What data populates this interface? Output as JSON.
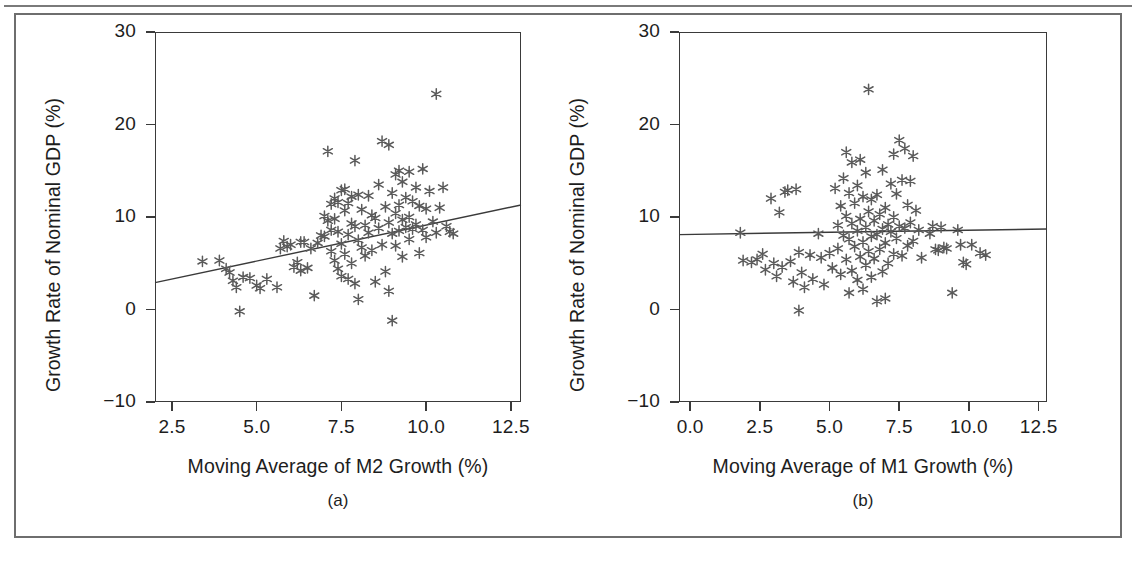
{
  "figure": {
    "panels": [
      {
        "id": "panel-a",
        "caption": "(a)",
        "xlabel": "Moving Average of M2 Growth (%)",
        "ylabel": "Growth Rate of Nominal GDP (%)",
        "xticks": [
          "2.5",
          "5.0",
          "7.5",
          "10.0",
          "12.5"
        ],
        "yticks": [
          "30",
          "20",
          "10",
          "0",
          "−10"
        ]
      },
      {
        "id": "panel-b",
        "caption": "(b)",
        "xlabel": "Moving Average of M1 Growth (%)",
        "ylabel": "Growth Rate of Nominal GDP (%)",
        "xticks": [
          "0.0",
          "2.5",
          "5.0",
          "7.5",
          "10.0",
          "12.5"
        ],
        "yticks": [
          "30",
          "20",
          "10",
          "0",
          "−10"
        ]
      }
    ],
    "colors": {
      "marker": "#5a5a5a",
      "axis": "#3a3a3a",
      "fit_line": "#3a3a3a",
      "figure_border": "#6e6e6e",
      "text": "#1d1d1d"
    }
  },
  "chart_data": [
    {
      "type": "scatter",
      "id": "panel-a",
      "title": "(a)",
      "xlabel": "Moving Average of M2 Growth (%)",
      "ylabel": "Growth Rate of Nominal GDP (%)",
      "xlim": [
        2.0,
        12.8
      ],
      "ylim": [
        -10,
        30
      ],
      "xticks": [
        2.5,
        5.0,
        7.5,
        10.0,
        12.5
      ],
      "yticks": [
        -10,
        0,
        10,
        20,
        30
      ],
      "grid": false,
      "legend": "none",
      "marker": "asterisk",
      "fit_line": {
        "x": [
          2.0,
          12.8
        ],
        "y": [
          2.9,
          11.3
        ],
        "label": "least-squares fit"
      },
      "points": [
        [
          3.4,
          5.2
        ],
        [
          3.9,
          5.3
        ],
        [
          4.1,
          4.4
        ],
        [
          4.2,
          4.0
        ],
        [
          4.3,
          3.1
        ],
        [
          4.4,
          2.4
        ],
        [
          4.5,
          -0.2
        ],
        [
          4.6,
          3.5
        ],
        [
          4.8,
          3.4
        ],
        [
          5.0,
          2.6
        ],
        [
          5.1,
          2.3
        ],
        [
          5.3,
          3.3
        ],
        [
          5.6,
          2.4
        ],
        [
          5.7,
          6.6
        ],
        [
          5.8,
          7.4
        ],
        [
          5.9,
          6.8
        ],
        [
          6.0,
          7.0
        ],
        [
          6.1,
          4.6
        ],
        [
          6.2,
          5.1
        ],
        [
          6.3,
          7.3
        ],
        [
          6.3,
          4.2
        ],
        [
          6.4,
          7.3
        ],
        [
          6.5,
          4.5
        ],
        [
          6.6,
          6.6
        ],
        [
          6.7,
          1.5
        ],
        [
          6.8,
          7.2
        ],
        [
          6.9,
          8.0
        ],
        [
          7.0,
          7.9
        ],
        [
          7.0,
          10.1
        ],
        [
          7.1,
          9.6
        ],
        [
          7.1,
          17.1
        ],
        [
          7.2,
          11.4
        ],
        [
          7.2,
          8.6
        ],
        [
          7.2,
          6.3
        ],
        [
          7.3,
          12.0
        ],
        [
          7.3,
          9.8
        ],
        [
          7.3,
          5.3
        ],
        [
          7.4,
          11.6
        ],
        [
          7.4,
          8.4
        ],
        [
          7.4,
          4.4
        ],
        [
          7.5,
          12.9
        ],
        [
          7.5,
          7.1
        ],
        [
          7.5,
          3.6
        ],
        [
          7.6,
          13.0
        ],
        [
          7.6,
          10.7
        ],
        [
          7.6,
          6.0
        ],
        [
          7.7,
          11.5
        ],
        [
          7.7,
          8.1
        ],
        [
          7.7,
          3.3
        ],
        [
          7.8,
          12.2
        ],
        [
          7.8,
          9.3
        ],
        [
          7.8,
          5.0
        ],
        [
          7.9,
          16.1
        ],
        [
          7.9,
          9.0
        ],
        [
          7.9,
          2.8
        ],
        [
          8.0,
          12.4
        ],
        [
          8.0,
          7.5
        ],
        [
          8.0,
          1.1
        ],
        [
          8.1,
          10.8
        ],
        [
          8.1,
          6.7
        ],
        [
          8.2,
          9.1
        ],
        [
          8.2,
          5.8
        ],
        [
          8.3,
          12.3
        ],
        [
          8.3,
          8.3
        ],
        [
          8.4,
          10.2
        ],
        [
          8.4,
          6.4
        ],
        [
          8.5,
          9.9
        ],
        [
          8.5,
          3.0
        ],
        [
          8.6,
          13.5
        ],
        [
          8.6,
          8.8
        ],
        [
          8.7,
          18.2
        ],
        [
          8.7,
          7.0
        ],
        [
          8.8,
          11.1
        ],
        [
          8.8,
          4.1
        ],
        [
          8.9,
          17.8
        ],
        [
          8.9,
          9.4
        ],
        [
          8.9,
          2.0
        ],
        [
          9.0,
          12.6
        ],
        [
          9.0,
          8.2
        ],
        [
          9.0,
          -1.2
        ],
        [
          9.1,
          14.6
        ],
        [
          9.1,
          10.4
        ],
        [
          9.1,
          6.9
        ],
        [
          9.2,
          15.0
        ],
        [
          9.2,
          11.3
        ],
        [
          9.2,
          8.5
        ],
        [
          9.3,
          13.8
        ],
        [
          9.3,
          9.7
        ],
        [
          9.3,
          5.7
        ],
        [
          9.4,
          12.1
        ],
        [
          9.4,
          8.9
        ],
        [
          9.5,
          14.9
        ],
        [
          9.5,
          10.0
        ],
        [
          9.5,
          7.6
        ],
        [
          9.6,
          11.7
        ],
        [
          9.6,
          8.7
        ],
        [
          9.7,
          13.2
        ],
        [
          9.7,
          9.2
        ],
        [
          9.8,
          11.2
        ],
        [
          9.8,
          6.1
        ],
        [
          9.9,
          15.2
        ],
        [
          9.9,
          8.6
        ],
        [
          10.0,
          10.9
        ],
        [
          10.0,
          7.8
        ],
        [
          10.1,
          12.8
        ],
        [
          10.2,
          9.5
        ],
        [
          10.3,
          23.3
        ],
        [
          10.3,
          8.3
        ],
        [
          10.4,
          11.0
        ],
        [
          10.5,
          13.2
        ],
        [
          10.6,
          9.0
        ],
        [
          10.7,
          8.4
        ],
        [
          10.8,
          8.2
        ]
      ]
    },
    {
      "type": "scatter",
      "id": "panel-b",
      "title": "(b)",
      "xlabel": "Moving Average of M1 Growth (%)",
      "ylabel": "Growth Rate of Nominal GDP (%)",
      "xlim": [
        -0.4,
        12.8
      ],
      "ylim": [
        -10,
        30
      ],
      "xticks": [
        0.0,
        2.5,
        5.0,
        7.5,
        10.0,
        12.5
      ],
      "yticks": [
        -10,
        0,
        10,
        20,
        30
      ],
      "grid": false,
      "legend": "none",
      "marker": "asterisk",
      "fit_line": {
        "x": [
          -0.4,
          12.8
        ],
        "y": [
          8.1,
          8.7
        ],
        "label": "least-squares fit"
      },
      "points": [
        [
          1.8,
          8.3
        ],
        [
          1.9,
          5.3
        ],
        [
          2.2,
          5.1
        ],
        [
          2.4,
          5.4
        ],
        [
          2.6,
          6.0
        ],
        [
          2.7,
          4.3
        ],
        [
          2.9,
          12.0
        ],
        [
          3.0,
          5.0
        ],
        [
          3.1,
          3.6
        ],
        [
          3.2,
          10.5
        ],
        [
          3.3,
          4.6
        ],
        [
          3.4,
          12.7
        ],
        [
          3.5,
          12.9
        ],
        [
          3.6,
          5.2
        ],
        [
          3.7,
          3.0
        ],
        [
          3.8,
          13.0
        ],
        [
          3.9,
          6.2
        ],
        [
          3.9,
          -0.1
        ],
        [
          4.0,
          4.0
        ],
        [
          4.1,
          2.4
        ],
        [
          4.3,
          5.9
        ],
        [
          4.4,
          3.3
        ],
        [
          4.6,
          8.2
        ],
        [
          4.7,
          5.6
        ],
        [
          4.8,
          2.7
        ],
        [
          5.0,
          6.1
        ],
        [
          5.1,
          4.5
        ],
        [
          5.2,
          13.1
        ],
        [
          5.3,
          9.1
        ],
        [
          5.3,
          6.6
        ],
        [
          5.4,
          11.2
        ],
        [
          5.4,
          3.8
        ],
        [
          5.5,
          14.2
        ],
        [
          5.5,
          8.0
        ],
        [
          5.6,
          17.0
        ],
        [
          5.6,
          10.1
        ],
        [
          5.6,
          5.4
        ],
        [
          5.7,
          12.6
        ],
        [
          5.7,
          7.6
        ],
        [
          5.7,
          1.8
        ],
        [
          5.8,
          15.9
        ],
        [
          5.8,
          9.3
        ],
        [
          5.8,
          4.2
        ],
        [
          5.9,
          11.5
        ],
        [
          5.9,
          6.8
        ],
        [
          6.0,
          13.4
        ],
        [
          6.0,
          8.5
        ],
        [
          6.0,
          3.2
        ],
        [
          6.1,
          16.2
        ],
        [
          6.1,
          9.8
        ],
        [
          6.1,
          5.7
        ],
        [
          6.2,
          12.2
        ],
        [
          6.2,
          7.3
        ],
        [
          6.2,
          2.2
        ],
        [
          6.3,
          14.8
        ],
        [
          6.3,
          8.9
        ],
        [
          6.3,
          4.8
        ],
        [
          6.4,
          23.8
        ],
        [
          6.4,
          10.6
        ],
        [
          6.4,
          6.3
        ],
        [
          6.5,
          11.9
        ],
        [
          6.5,
          7.9
        ],
        [
          6.5,
          3.5
        ],
        [
          6.6,
          9.6
        ],
        [
          6.6,
          5.5
        ],
        [
          6.7,
          12.4
        ],
        [
          6.7,
          8.1
        ],
        [
          6.7,
          0.9
        ],
        [
          6.8,
          10.3
        ],
        [
          6.8,
          6.5
        ],
        [
          6.9,
          15.1
        ],
        [
          6.9,
          8.7
        ],
        [
          6.9,
          4.1
        ],
        [
          7.0,
          11.0
        ],
        [
          7.0,
          7.2
        ],
        [
          7.0,
          1.2
        ],
        [
          7.1,
          9.2
        ],
        [
          7.1,
          5.0
        ],
        [
          7.2,
          13.6
        ],
        [
          7.2,
          8.4
        ],
        [
          7.3,
          16.8
        ],
        [
          7.3,
          10.0
        ],
        [
          7.3,
          6.0
        ],
        [
          7.4,
          12.5
        ],
        [
          7.4,
          7.7
        ],
        [
          7.5,
          18.3
        ],
        [
          7.5,
          9.0
        ],
        [
          7.6,
          14.0
        ],
        [
          7.6,
          5.8
        ],
        [
          7.7,
          17.4
        ],
        [
          7.7,
          8.8
        ],
        [
          7.8,
          11.3
        ],
        [
          7.8,
          6.9
        ],
        [
          7.9,
          13.9
        ],
        [
          7.9,
          9.4
        ],
        [
          8.0,
          16.6
        ],
        [
          8.0,
          7.4
        ],
        [
          8.1,
          10.7
        ],
        [
          8.2,
          8.6
        ],
        [
          8.3,
          5.6
        ],
        [
          8.6,
          8.2
        ],
        [
          8.7,
          9.0
        ],
        [
          8.8,
          6.5
        ],
        [
          8.9,
          6.4
        ],
        [
          9.0,
          8.9
        ],
        [
          9.1,
          6.7
        ],
        [
          9.2,
          6.6
        ],
        [
          9.4,
          1.8
        ],
        [
          9.6,
          8.6
        ],
        [
          9.7,
          7.0
        ],
        [
          9.8,
          5.1
        ],
        [
          9.9,
          4.9
        ],
        [
          10.1,
          7.0
        ],
        [
          10.4,
          6.1
        ],
        [
          10.6,
          5.9
        ]
      ]
    }
  ]
}
